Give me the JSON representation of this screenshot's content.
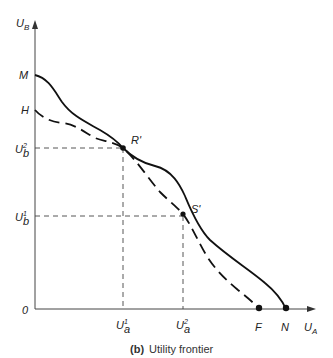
{
  "diagram": {
    "y_axis_label_main": "U",
    "y_axis_label_sub": "B",
    "x_axis_label_main": "U",
    "x_axis_label_sub": "A",
    "origin_label": "0",
    "y_points": {
      "M": "M",
      "H": "H",
      "ub2_main": "U",
      "ub2_sub": "b",
      "ub2_sup": "2",
      "ub1_main": "U",
      "ub1_sub": "b",
      "ub1_sup": "1"
    },
    "x_points": {
      "ua1_main": "U",
      "ua1_sub": "a",
      "ua1_sup": "1",
      "ua2_main": "U",
      "ua2_sub": "a",
      "ua2_sup": "2",
      "F": "F",
      "N": "N"
    },
    "curve_points": {
      "R": "R'",
      "S": "S'"
    },
    "curves": [
      {
        "name": "MN",
        "style": "solid",
        "from": "M",
        "to": "N"
      },
      {
        "name": "HF",
        "style": "dashed",
        "from": "H",
        "to": "F"
      }
    ],
    "caption_prefix": "(b)",
    "caption_text": "Utility frontier"
  }
}
